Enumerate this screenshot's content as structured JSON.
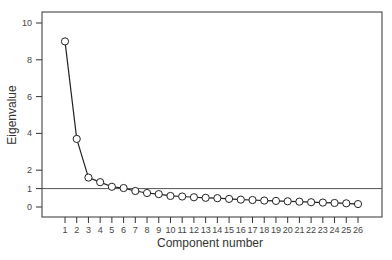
{
  "chart_data": {
    "type": "line",
    "title": "",
    "xlabel": "Component number",
    "ylabel": "Eigenvalue",
    "x": [
      1,
      2,
      3,
      4,
      5,
      6,
      7,
      8,
      9,
      10,
      11,
      12,
      13,
      14,
      15,
      16,
      17,
      18,
      19,
      20,
      21,
      22,
      23,
      24,
      25,
      26
    ],
    "series": [
      {
        "name": "Eigenvalue",
        "values": [
          9.0,
          3.7,
          1.6,
          1.35,
          1.1,
          1.03,
          0.87,
          0.76,
          0.7,
          0.6,
          0.57,
          0.53,
          0.5,
          0.48,
          0.44,
          0.4,
          0.38,
          0.35,
          0.33,
          0.31,
          0.29,
          0.26,
          0.24,
          0.22,
          0.2,
          0.16
        ],
        "marker": "open-circle",
        "color": "#222222"
      }
    ],
    "reference_line": {
      "y": 1,
      "label": "Kaiser criterion (eigenvalue = 1)",
      "color": "#555555"
    },
    "yticks": [
      0,
      1,
      2,
      4,
      6,
      8,
      10
    ],
    "xticks": [
      1,
      2,
      3,
      4,
      5,
      6,
      7,
      8,
      9,
      10,
      11,
      12,
      13,
      14,
      15,
      16,
      17,
      18,
      19,
      20,
      21,
      22,
      23,
      24,
      25,
      26
    ],
    "ylim": [
      -0.5,
      10.5
    ],
    "xlim": [
      -0.9,
      28.2
    ],
    "grid": false,
    "legend": null
  },
  "axis": {
    "x_title": "Component number",
    "y_title": "Eigenvalue"
  }
}
